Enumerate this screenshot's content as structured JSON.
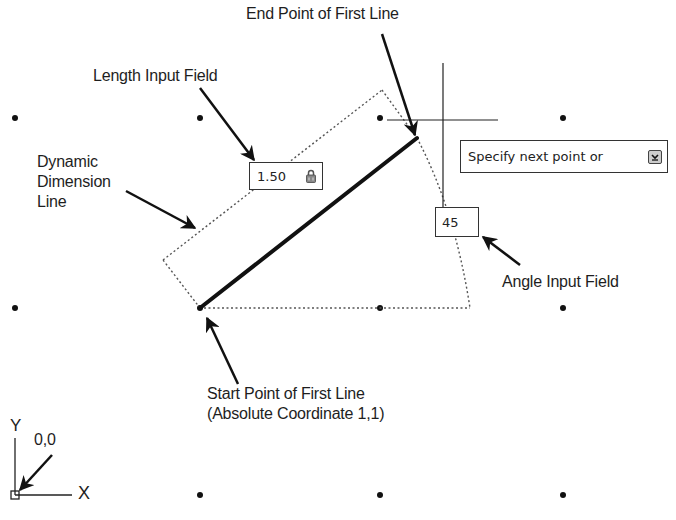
{
  "labels": {
    "end_point": "End Point of First Line",
    "length_field": "Length Input Field",
    "dynamic_dimension": [
      "Dynamic",
      "Dimension",
      "Line"
    ],
    "angle_field": "Angle Input Field",
    "start_point_line1": "Start Point of First Line",
    "start_point_line2": "(Absolute Coordinate 1,1)",
    "origin": "0,0",
    "axis_x": "X",
    "axis_y": "Y"
  },
  "inputs": {
    "length_value": "1.50",
    "angle_value": "45",
    "prompt_text": "Specify next point or"
  },
  "icons": {
    "length_lock": "lock-icon",
    "prompt_dropdown": "down-arrow-icon"
  },
  "geometry": {
    "grid_x": [
      15,
      200,
      380,
      563
    ],
    "grid_y": [
      118,
      308,
      495
    ],
    "line_start": [
      200,
      308
    ],
    "line_end": [
      417,
      138
    ],
    "crosshair_center": [
      443,
      120
    ]
  },
  "colors": {
    "ink": "#111111",
    "field_border": "#333333",
    "dotted": "#555555"
  }
}
